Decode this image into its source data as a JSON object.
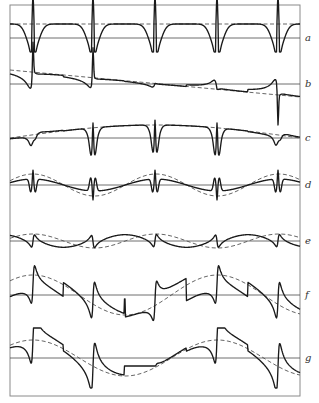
{
  "figure": {
    "frame": {
      "x": 10,
      "y": 5,
      "width": 290,
      "height": 391
    },
    "spike_x": [
      33,
      93,
      155,
      217,
      278
    ],
    "period_px": 61.5,
    "rows": [
      {
        "label": "a",
        "baseline_y": 38,
        "dashed": {
          "type": "flat",
          "y": 24
        },
        "curve": "dips-to-baseline"
      },
      {
        "label": "b",
        "baseline_y": 84,
        "dashed": {
          "type": "linear",
          "y_start": 70,
          "y_end": 97
        },
        "curve": "sloped-with-resonances"
      },
      {
        "label": "c",
        "baseline_y": 138,
        "dashed": {
          "type": "arch",
          "y_edge": 138,
          "y_mid": 125
        },
        "curve": "arch-with-resonances"
      },
      {
        "label": "d",
        "baseline_y": 185,
        "dashed": {
          "type": "cosine",
          "amplitude": 11,
          "period_factor": 2
        },
        "curve": "cosine-with-resonances"
      },
      {
        "label": "e",
        "baseline_y": 241,
        "dashed": {
          "type": "cosine",
          "amplitude": 7,
          "period_factor": 2
        },
        "curve": "alternating-lobes"
      },
      {
        "label": "f",
        "baseline_y": 295,
        "dashed": {
          "type": "cosine",
          "amplitude": 20,
          "period_factor": 3
        },
        "curve": "sawtooth-with-resonances"
      },
      {
        "label": "g",
        "baseline_y": 358,
        "dashed": {
          "type": "cosine",
          "amplitude": 18,
          "period_factor": 3
        },
        "curve": "deep-lobes"
      }
    ]
  }
}
